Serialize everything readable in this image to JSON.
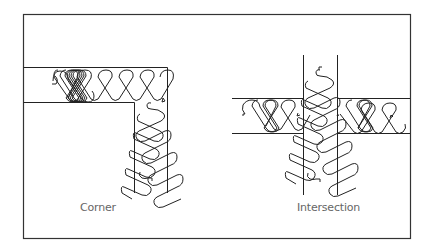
{
  "diagram": {
    "type": "insulation-batt-installation-details",
    "panels": [
      {
        "id": "corner",
        "label": "Corner"
      },
      {
        "id": "intersection",
        "label": "Intersection"
      }
    ]
  },
  "colors": {
    "line": "#222222",
    "label": "#666666",
    "background": "#ffffff"
  }
}
